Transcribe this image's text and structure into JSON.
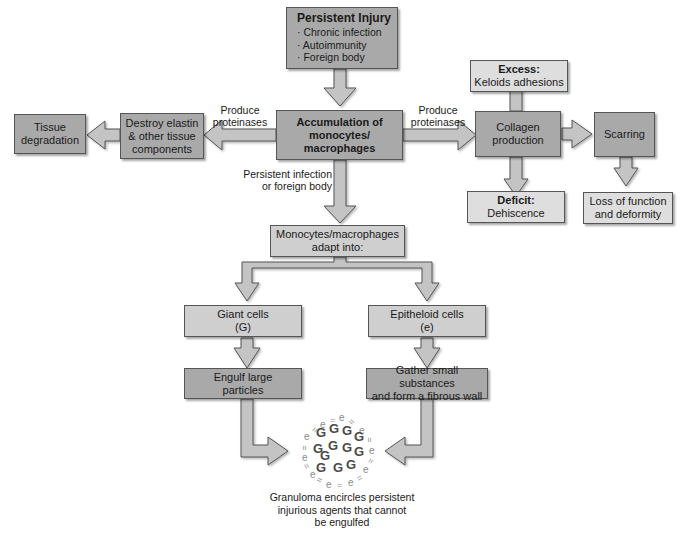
{
  "diagram": {
    "persistent_injury": {
      "title": "Persistent Injury",
      "items": [
        "Chronic infection",
        "Autoimmunity",
        "Foreign body"
      ],
      "bullet": "·"
    },
    "accumulation": {
      "line1": "Accumulation of",
      "line2": "monocytes/",
      "line3": "macrophages"
    },
    "destroy": {
      "line1": "Destroy elastin",
      "line2": "& other tissue",
      "line3": "components"
    },
    "tissue_degradation": {
      "line1": "Tissue",
      "line2": "degradation"
    },
    "produce_left": {
      "line1": "Produce",
      "line2": "proteinases"
    },
    "produce_right": {
      "line1": "Produce",
      "line2": "proteinases"
    },
    "collagen": {
      "line1": "Collagen",
      "line2": "production"
    },
    "excess": {
      "title": "Excess:",
      "text": "Keloids adhesions"
    },
    "deficit": {
      "title": "Deficit:",
      "text": "Dehiscence"
    },
    "scarring": {
      "text": "Scarring"
    },
    "loss": {
      "line1": "Loss of function",
      "line2": "and deformity"
    },
    "persistent_infection_label": {
      "line1": "Persistent infection",
      "line2": "or foreign body"
    },
    "adapt": {
      "line1": "Monocytes/macrophages",
      "line2": "adapt into:"
    },
    "giant": {
      "line1": "Giant cells",
      "line2": "(G)"
    },
    "epithelioid": {
      "line1": "Epitheloid cells",
      "line2": "(e)"
    },
    "engulf": {
      "line1": "Engulf large",
      "line2": "particles"
    },
    "gather": {
      "line1": "Gather small substances",
      "line2": "and form a fibrous wall"
    },
    "granuloma": {
      "symbol_giant": "G",
      "symbol_epi": "e",
      "symbol_wall": "="
    },
    "caption": {
      "line1": "Granuloma encircles persistent",
      "line2": "injurious agents that cannot",
      "line3": "be engulfed"
    }
  },
  "colors": {
    "box_dark": "#a9a9a9",
    "box_light": "#cfcfcf",
    "arrow_fill": "#c4c4c4",
    "arrow_stroke": "#555555"
  }
}
